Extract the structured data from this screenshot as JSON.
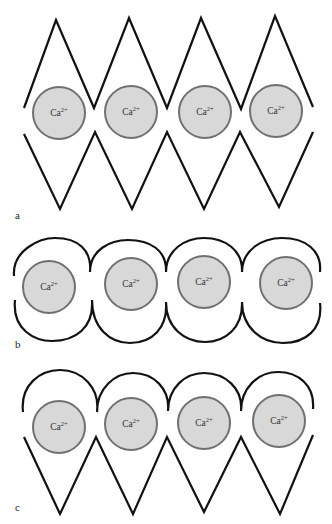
{
  "figure": {
    "ion_label_base": "Ca",
    "ion_label_charge": "2+",
    "colors": {
      "line": "#111111",
      "ion_fill": "#d8d8d8",
      "ion_stroke": "#707070",
      "background": "#ffffff"
    },
    "panels": [
      {
        "label": "a",
        "description": "Both chains zigzag (egg-box) around four Ca2+ ions",
        "ions": [
          {
            "text": "Ca2+"
          },
          {
            "text": "Ca2+"
          },
          {
            "text": "Ca2+"
          },
          {
            "text": "Ca2+"
          }
        ]
      },
      {
        "label": "b",
        "description": "Both chains arched around four Ca2+ ions",
        "ions": [
          {
            "text": "Ca2+"
          },
          {
            "text": "Ca2+"
          },
          {
            "text": "Ca2+"
          },
          {
            "text": "Ca2+"
          }
        ]
      },
      {
        "label": "c",
        "description": "Upper chain arched, lower chain zigzag around four Ca2+ ions",
        "ions": [
          {
            "text": "Ca2+"
          },
          {
            "text": "Ca2+"
          },
          {
            "text": "Ca2+"
          },
          {
            "text": "Ca2+"
          }
        ]
      }
    ]
  }
}
